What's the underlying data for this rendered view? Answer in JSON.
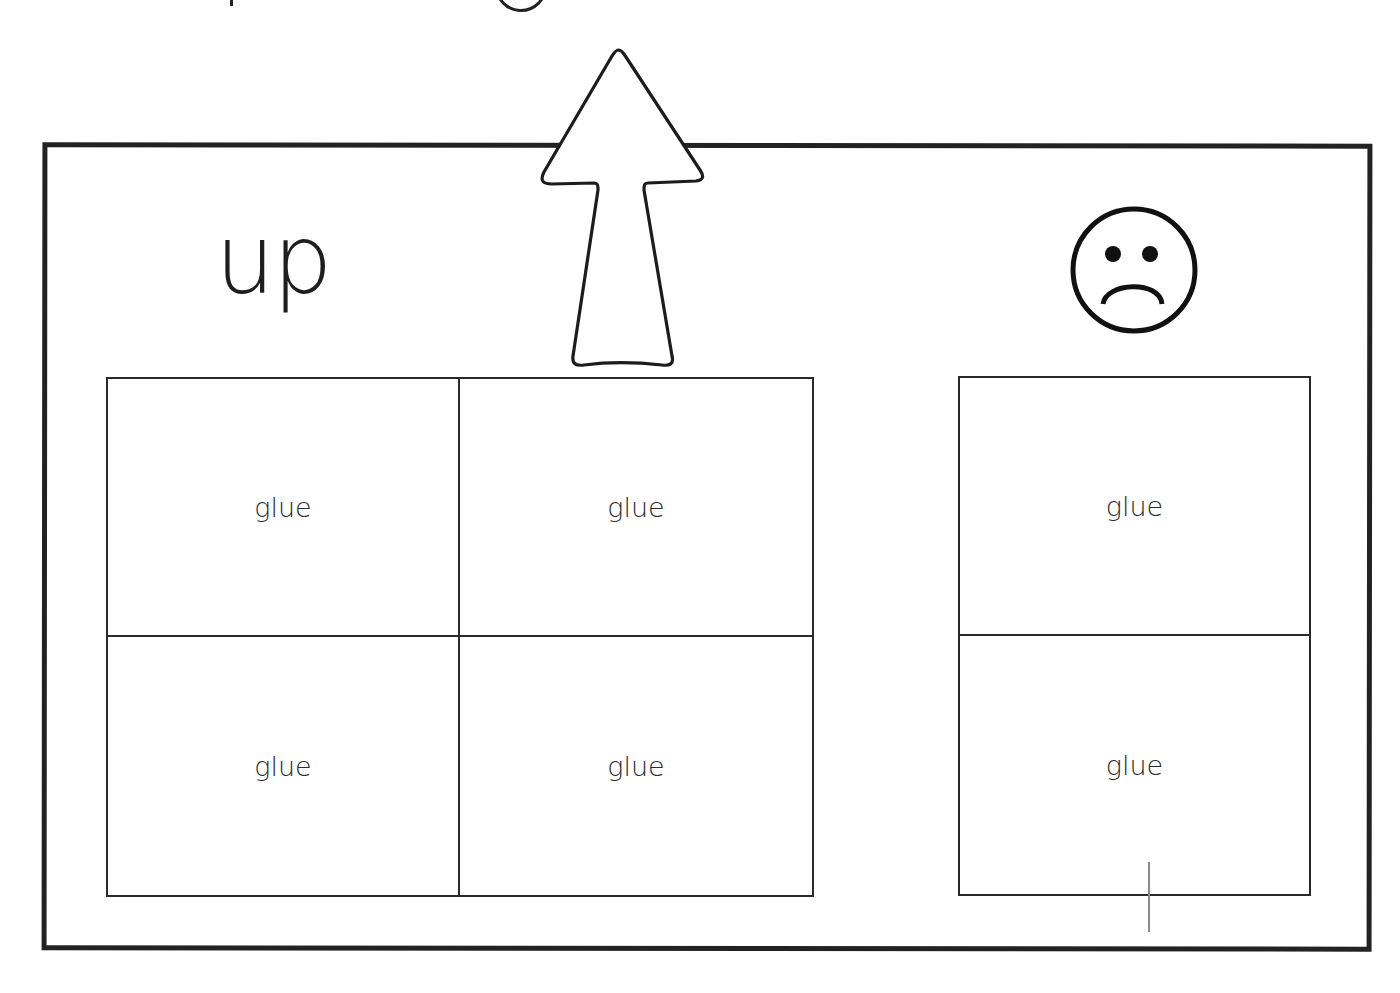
{
  "worksheet": {
    "top_partial_text": "",
    "word": "up",
    "icons": {
      "arrow": "up-arrow-icon",
      "face": "sad-face-icon"
    },
    "left_grid": {
      "cells": [
        "glue",
        "glue",
        "glue",
        "glue"
      ]
    },
    "right_grid": {
      "cells": [
        "glue",
        "glue"
      ]
    },
    "colors": {
      "ink": "#222222",
      "background": "#ffffff",
      "stray_line": "#8a8a8a"
    }
  }
}
